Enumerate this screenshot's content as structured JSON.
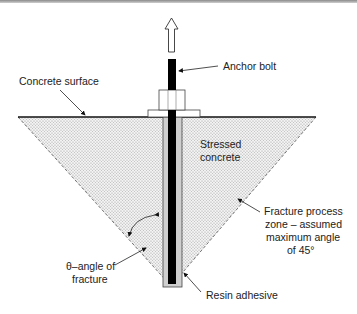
{
  "diagram": {
    "type": "anchor-bolt-pullout-cross-section",
    "labels": {
      "anchor_bolt": "Anchor bolt",
      "concrete_surface": "Concrete surface",
      "stressed_concrete_1": "Stressed",
      "stressed_concrete_2": "concrete",
      "fracture_zone_1": "Fracture process",
      "fracture_zone_2": "zone – assumed",
      "fracture_zone_3": "maximum angle",
      "fracture_zone_4": "of 45°",
      "theta_1": "θ–angle of",
      "theta_2": "fracture",
      "resin": "Resin adhesive"
    },
    "colors": {
      "bolt": "#000000",
      "resin": "#c8c8c8",
      "concrete_fill": "#e6e6e6",
      "line": "#111111"
    }
  }
}
